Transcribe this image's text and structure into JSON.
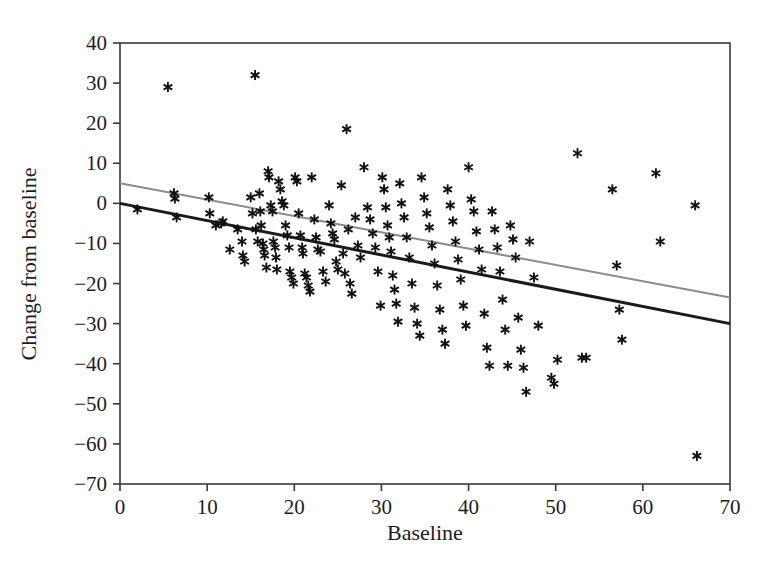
{
  "chart_data": {
    "type": "scatter",
    "title": "",
    "xlabel": "Baseline",
    "ylabel": "Change from baseline",
    "xlim": [
      0,
      70
    ],
    "ylim": [
      -70,
      40
    ],
    "xticks": [
      0,
      10,
      20,
      30,
      40,
      50,
      60,
      70
    ],
    "yticks": [
      40,
      30,
      20,
      10,
      0,
      -10,
      -20,
      -30,
      -40,
      -50,
      -60,
      -70
    ],
    "grid": false,
    "legend": "none",
    "marker": "asterisk",
    "marker_color": "#111111",
    "points": [
      [
        2.0,
        -1.5
      ],
      [
        5.5,
        29.0
      ],
      [
        6.2,
        2.5
      ],
      [
        6.3,
        1.2
      ],
      [
        6.5,
        -3.5
      ],
      [
        10.2,
        1.5
      ],
      [
        10.3,
        -2.5
      ],
      [
        11.0,
        -5.5
      ],
      [
        11.6,
        -5.0
      ],
      [
        11.8,
        -4.5
      ],
      [
        12.6,
        -11.5
      ],
      [
        13.5,
        -6.5
      ],
      [
        14.0,
        -9.5
      ],
      [
        14.1,
        -13.0
      ],
      [
        14.3,
        -14.5
      ],
      [
        15.0,
        1.5
      ],
      [
        15.2,
        -2.5
      ],
      [
        15.5,
        32.0
      ],
      [
        15.6,
        -6.5
      ],
      [
        15.8,
        -9.5
      ],
      [
        16.0,
        2.5
      ],
      [
        16.1,
        -2.0
      ],
      [
        16.2,
        -5.5
      ],
      [
        16.4,
        -10.0
      ],
      [
        16.5,
        -11.5
      ],
      [
        16.6,
        -13.0
      ],
      [
        16.8,
        -16.0
      ],
      [
        17.0,
        8.0
      ],
      [
        17.1,
        6.5
      ],
      [
        17.3,
        -0.5
      ],
      [
        17.5,
        -2.0
      ],
      [
        17.6,
        -9.5
      ],
      [
        17.8,
        -11.0
      ],
      [
        17.9,
        -13.5
      ],
      [
        18.0,
        -16.5
      ],
      [
        18.2,
        5.5
      ],
      [
        18.4,
        3.5
      ],
      [
        18.6,
        0.5
      ],
      [
        18.8,
        -0.5
      ],
      [
        19.0,
        -5.5
      ],
      [
        19.2,
        -8.0
      ],
      [
        19.4,
        -11.0
      ],
      [
        19.5,
        -17.0
      ],
      [
        19.7,
        -18.5
      ],
      [
        19.9,
        -20.0
      ],
      [
        20.1,
        6.5
      ],
      [
        20.3,
        5.5
      ],
      [
        20.5,
        -2.5
      ],
      [
        20.7,
        -8.0
      ],
      [
        20.9,
        -11.0
      ],
      [
        21.0,
        -12.5
      ],
      [
        21.2,
        -17.5
      ],
      [
        21.4,
        -18.5
      ],
      [
        21.6,
        -20.5
      ],
      [
        21.8,
        -22.0
      ],
      [
        22.0,
        6.5
      ],
      [
        22.3,
        -4.0
      ],
      [
        22.5,
        -8.5
      ],
      [
        22.7,
        -11.5
      ],
      [
        23.0,
        -12.0
      ],
      [
        23.3,
        -17.0
      ],
      [
        23.6,
        -19.5
      ],
      [
        24.0,
        -0.5
      ],
      [
        24.2,
        -5.0
      ],
      [
        24.4,
        -7.5
      ],
      [
        24.6,
        -9.0
      ],
      [
        24.8,
        -14.5
      ],
      [
        25.0,
        -16.5
      ],
      [
        25.4,
        4.5
      ],
      [
        25.6,
        -12.5
      ],
      [
        25.8,
        -17.5
      ],
      [
        26.0,
        18.5
      ],
      [
        26.2,
        -6.5
      ],
      [
        26.4,
        -20.0
      ],
      [
        26.6,
        -22.5
      ],
      [
        27.0,
        -3.5
      ],
      [
        27.3,
        -10.5
      ],
      [
        27.6,
        -13.5
      ],
      [
        28.0,
        9.0
      ],
      [
        28.4,
        -1.0
      ],
      [
        28.7,
        -4.0
      ],
      [
        29.0,
        -7.5
      ],
      [
        29.3,
        -11.0
      ],
      [
        29.6,
        -17.0
      ],
      [
        29.9,
        -25.5
      ],
      [
        30.1,
        6.5
      ],
      [
        30.3,
        3.5
      ],
      [
        30.5,
        -1.0
      ],
      [
        30.7,
        -5.5
      ],
      [
        30.9,
        -8.5
      ],
      [
        31.1,
        -12.0
      ],
      [
        31.3,
        -18.0
      ],
      [
        31.5,
        -21.5
      ],
      [
        31.7,
        -25.0
      ],
      [
        31.9,
        -29.5
      ],
      [
        32.1,
        5.0
      ],
      [
        32.3,
        0.0
      ],
      [
        32.6,
        -3.5
      ],
      [
        32.9,
        -8.5
      ],
      [
        33.2,
        -13.5
      ],
      [
        33.5,
        -20.0
      ],
      [
        33.8,
        -26.0
      ],
      [
        34.1,
        -30.0
      ],
      [
        34.4,
        -33.0
      ],
      [
        34.6,
        6.5
      ],
      [
        34.9,
        1.5
      ],
      [
        35.2,
        -2.5
      ],
      [
        35.5,
        -6.0
      ],
      [
        35.8,
        -10.5
      ],
      [
        36.1,
        -15.0
      ],
      [
        36.4,
        -20.5
      ],
      [
        36.7,
        -26.5
      ],
      [
        37.0,
        -31.5
      ],
      [
        37.3,
        -35.0
      ],
      [
        37.6,
        3.5
      ],
      [
        37.9,
        -0.5
      ],
      [
        38.2,
        -4.5
      ],
      [
        38.5,
        -9.5
      ],
      [
        38.8,
        -14.0
      ],
      [
        39.1,
        -19.0
      ],
      [
        39.4,
        -25.5
      ],
      [
        39.7,
        -30.5
      ],
      [
        40.0,
        9.0
      ],
      [
        40.3,
        1.0
      ],
      [
        40.6,
        -2.0
      ],
      [
        40.9,
        -7.0
      ],
      [
        41.2,
        -11.5
      ],
      [
        41.5,
        -16.5
      ],
      [
        41.8,
        -27.5
      ],
      [
        42.1,
        -36.0
      ],
      [
        42.4,
        -40.5
      ],
      [
        42.7,
        -2.0
      ],
      [
        43.0,
        -6.5
      ],
      [
        43.3,
        -11.0
      ],
      [
        43.6,
        -17.0
      ],
      [
        43.9,
        -24.0
      ],
      [
        44.2,
        -31.5
      ],
      [
        44.5,
        -40.5
      ],
      [
        44.8,
        -5.5
      ],
      [
        45.1,
        -9.0
      ],
      [
        45.4,
        -13.5
      ],
      [
        45.7,
        -28.5
      ],
      [
        46.0,
        -36.5
      ],
      [
        46.3,
        -41.0
      ],
      [
        46.6,
        -47.0
      ],
      [
        47.0,
        -9.5
      ],
      [
        47.5,
        -18.5
      ],
      [
        48.0,
        -30.5
      ],
      [
        49.5,
        -43.5
      ],
      [
        49.8,
        -45.0
      ],
      [
        50.2,
        -39.0
      ],
      [
        52.5,
        12.5
      ],
      [
        53.0,
        -38.5
      ],
      [
        53.5,
        -38.5
      ],
      [
        56.5,
        3.5
      ],
      [
        57.0,
        -15.5
      ],
      [
        57.3,
        -26.5
      ],
      [
        57.6,
        -34.0
      ],
      [
        61.5,
        7.5
      ],
      [
        62.0,
        -9.5
      ],
      [
        66.0,
        -0.5
      ],
      [
        66.2,
        -63.0
      ]
    ],
    "trend_lines": [
      {
        "name": "upper-regression-line",
        "color": "#8c8c8c",
        "width": 2,
        "x_start": 0,
        "y_start": 5.0,
        "x_end": 70,
        "y_end": -23.5
      },
      {
        "name": "lower-regression-line",
        "color": "#1a1a1a",
        "width": 3,
        "x_start": 0,
        "y_start": 0.0,
        "x_end": 70,
        "y_end": -30.0
      }
    ]
  }
}
